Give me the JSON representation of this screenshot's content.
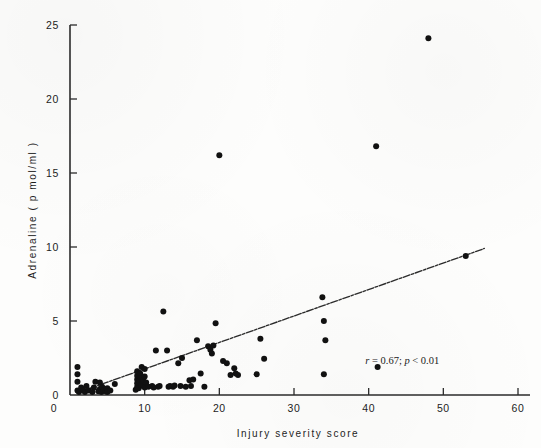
{
  "figure": {
    "background_color": "#fdfdfc",
    "ink_color": "#111111"
  },
  "annotation": {
    "statistic_r_label": "r",
    "statistic_text": " = 0.67; ",
    "statistic_p_label": "p",
    "statistic_p_text": " < 0.01",
    "full_text": "r = 0.67; p < 0.01"
  },
  "chart_data": {
    "type": "scatter",
    "title": "",
    "xlabel": "Injury severity score",
    "ylabel": "Adrenaline ( p mol/ml )",
    "xlim": [
      0,
      60
    ],
    "ylim": [
      0,
      25
    ],
    "xticks": [
      0,
      10,
      20,
      30,
      40,
      50,
      60
    ],
    "xticklabels": [
      "0",
      "10",
      "20",
      "30",
      "40",
      "50",
      "60"
    ],
    "yticks": [
      0,
      5,
      10,
      15,
      20,
      25
    ],
    "yticklabels": [
      "0",
      "5",
      "10",
      "15",
      "20",
      "25"
    ],
    "grid": false,
    "legend": null,
    "annotations": [
      {
        "text": "r = 0.67; p < 0.01",
        "x": 44.5,
        "y": 2.1
      }
    ],
    "trendline": {
      "type": "linear",
      "style": "dash-dot",
      "x_start": 1.0,
      "y_start": 0.15,
      "x_end": 55.5,
      "y_end": 9.9,
      "correlation_r": 0.67,
      "p_value_text": "< 0.01"
    },
    "series": [
      {
        "name": "patients",
        "marker": "filled-circle",
        "color": "#111111",
        "points": [
          [
            1.0,
            0.3
          ],
          [
            1.0,
            0.9
          ],
          [
            1.0,
            1.4
          ],
          [
            1.0,
            1.9
          ],
          [
            1.2,
            0.2
          ],
          [
            1.5,
            0.5
          ],
          [
            1.8,
            0.3
          ],
          [
            2.0,
            0.2
          ],
          [
            2.2,
            0.6
          ],
          [
            2.5,
            0.3
          ],
          [
            3.0,
            0.2
          ],
          [
            3.2,
            0.5
          ],
          [
            3.4,
            0.9
          ],
          [
            3.8,
            0.25
          ],
          [
            4.0,
            0.4
          ],
          [
            4.0,
            0.85
          ],
          [
            4.2,
            0.2
          ],
          [
            4.3,
            0.55
          ],
          [
            4.5,
            0.3
          ],
          [
            4.8,
            0.25
          ],
          [
            5.0,
            0.45
          ],
          [
            5.0,
            0.2
          ],
          [
            5.4,
            0.3
          ],
          [
            6.0,
            0.75
          ],
          [
            8.8,
            0.35
          ],
          [
            9.0,
            0.55
          ],
          [
            9.0,
            0.8
          ],
          [
            9.0,
            1.05
          ],
          [
            9.0,
            1.3
          ],
          [
            9.0,
            1.6
          ],
          [
            9.2,
            0.45
          ],
          [
            9.3,
            0.95
          ],
          [
            9.4,
            1.45
          ],
          [
            9.5,
            0.7
          ],
          [
            9.5,
            1.15
          ],
          [
            9.6,
            1.9
          ],
          [
            9.8,
            0.6
          ],
          [
            9.8,
            1.0
          ],
          [
            10.0,
            0.5
          ],
          [
            10.0,
            1.25
          ],
          [
            10.0,
            1.75
          ],
          [
            10.2,
            0.85
          ],
          [
            10.5,
            0.55
          ],
          [
            11.0,
            0.6
          ],
          [
            11.2,
            0.5
          ],
          [
            11.5,
            3.0
          ],
          [
            11.8,
            0.55
          ],
          [
            12.0,
            0.6
          ],
          [
            12.5,
            5.65
          ],
          [
            13.0,
            3.0
          ],
          [
            13.2,
            0.55
          ],
          [
            13.4,
            0.6
          ],
          [
            13.8,
            0.55
          ],
          [
            14.0,
            0.65
          ],
          [
            14.5,
            2.15
          ],
          [
            14.8,
            0.6
          ],
          [
            15.0,
            2.5
          ],
          [
            15.5,
            0.55
          ],
          [
            16.0,
            1.0
          ],
          [
            16.2,
            0.6
          ],
          [
            16.5,
            1.05
          ],
          [
            17.0,
            3.7
          ],
          [
            17.5,
            1.45
          ],
          [
            18.0,
            0.55
          ],
          [
            18.5,
            3.3
          ],
          [
            18.8,
            3.05
          ],
          [
            19.0,
            2.8
          ],
          [
            19.2,
            3.35
          ],
          [
            19.5,
            4.85
          ],
          [
            20.0,
            16.2
          ],
          [
            20.5,
            2.3
          ],
          [
            21.0,
            2.15
          ],
          [
            21.5,
            1.35
          ],
          [
            22.0,
            1.8
          ],
          [
            22.2,
            1.45
          ],
          [
            22.5,
            1.35
          ],
          [
            25.0,
            1.4
          ],
          [
            25.5,
            3.8
          ],
          [
            26.0,
            2.45
          ],
          [
            33.8,
            6.6
          ],
          [
            34.0,
            5.0
          ],
          [
            34.2,
            3.7
          ],
          [
            34.0,
            1.4
          ],
          [
            41.0,
            16.8
          ],
          [
            41.2,
            1.9
          ],
          [
            48.0,
            24.1
          ],
          [
            53.0,
            9.4
          ]
        ]
      }
    ]
  }
}
